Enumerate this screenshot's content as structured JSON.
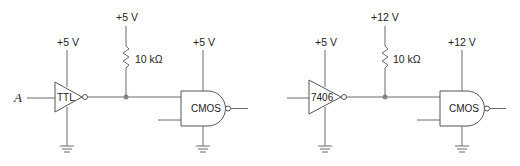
{
  "circuits": [
    {
      "name": "ttl-to-cmos-5v",
      "input_label": "A",
      "driver": {
        "label": "TTL",
        "supply": "+5 V"
      },
      "pullup": {
        "supply": "+5 V",
        "resistor": "10 kΩ"
      },
      "receiver": {
        "label": "CMOS",
        "supply": "+5 V"
      }
    },
    {
      "name": "7406-to-cmos-12v",
      "input_label": "",
      "driver": {
        "label": "7406",
        "supply": "+5 V"
      },
      "pullup": {
        "supply": "+12 V",
        "resistor": "10 kΩ"
      },
      "receiver": {
        "label": "CMOS",
        "supply": "+12 V"
      }
    }
  ],
  "colors": {
    "wire": "#6b6b6b",
    "junction": "#888888",
    "text": "#222222"
  }
}
